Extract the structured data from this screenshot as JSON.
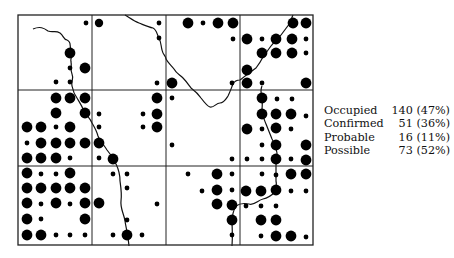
{
  "map": {
    "frame": {
      "x": 18,
      "y": 15,
      "w": 295,
      "h": 230
    },
    "grid_x": [
      92,
      166,
      240
    ],
    "grid_y": [
      90,
      166
    ],
    "dot_color": "#000000",
    "sizes": {
      "L": 5.4,
      "M": 4.2,
      "S": 2.4
    },
    "dots": [
      [
        86,
        23,
        "S"
      ],
      [
        99,
        23,
        "M"
      ],
      [
        159,
        23,
        "S"
      ],
      [
        188,
        23,
        "L"
      ],
      [
        203,
        23,
        "S"
      ],
      [
        218,
        23,
        "L"
      ],
      [
        233,
        23,
        "L"
      ],
      [
        293,
        23,
        "L"
      ],
      [
        306,
        23,
        "L"
      ],
      [
        159,
        38,
        "S"
      ],
      [
        233,
        39,
        "S"
      ],
      [
        247,
        39,
        "L"
      ],
      [
        262,
        39,
        "S"
      ],
      [
        276,
        39,
        "L"
      ],
      [
        292,
        39,
        "L"
      ],
      [
        306,
        39,
        "S"
      ],
      [
        70,
        53,
        "L"
      ],
      [
        262,
        53,
        "L"
      ],
      [
        276,
        53,
        "L"
      ],
      [
        292,
        53,
        "L"
      ],
      [
        306,
        53,
        "S"
      ],
      [
        70,
        68,
        "S"
      ],
      [
        85,
        68,
        "L"
      ],
      [
        247,
        70,
        "L"
      ],
      [
        56,
        82,
        "S"
      ],
      [
        70,
        82,
        "S"
      ],
      [
        157,
        83,
        "S"
      ],
      [
        172,
        83,
        "L"
      ],
      [
        232,
        83,
        "S"
      ],
      [
        247,
        83,
        "L"
      ],
      [
        262,
        83,
        "S"
      ],
      [
        306,
        83,
        "L"
      ],
      [
        56,
        98,
        "L"
      ],
      [
        70,
        98,
        "L"
      ],
      [
        85,
        98,
        "L"
      ],
      [
        157,
        98,
        "L"
      ],
      [
        172,
        98,
        "S"
      ],
      [
        262,
        98,
        "L"
      ],
      [
        277,
        99,
        "S"
      ],
      [
        292,
        99,
        "S"
      ],
      [
        56,
        113,
        "L"
      ],
      [
        85,
        113,
        "L"
      ],
      [
        99,
        114,
        "S"
      ],
      [
        143,
        114,
        "S"
      ],
      [
        157,
        114,
        "L"
      ],
      [
        262,
        114,
        "L"
      ],
      [
        276,
        114,
        "L"
      ],
      [
        291,
        114,
        "L"
      ],
      [
        306,
        116,
        "S"
      ],
      [
        27,
        127,
        "L"
      ],
      [
        41,
        127,
        "L"
      ],
      [
        56,
        127,
        "S"
      ],
      [
        70,
        127,
        "L"
      ],
      [
        99,
        127,
        "S"
      ],
      [
        143,
        127,
        "S"
      ],
      [
        157,
        127,
        "L"
      ],
      [
        247,
        129,
        "L"
      ],
      [
        262,
        129,
        "S"
      ],
      [
        276,
        128,
        "L"
      ],
      [
        291,
        129,
        "S"
      ],
      [
        27,
        143,
        "S"
      ],
      [
        41,
        143,
        "L"
      ],
      [
        56,
        143,
        "L"
      ],
      [
        70,
        143,
        "L"
      ],
      [
        85,
        143,
        "L"
      ],
      [
        99,
        143,
        "L"
      ],
      [
        172,
        145,
        "S"
      ],
      [
        262,
        145,
        "S"
      ],
      [
        276,
        145,
        "L"
      ],
      [
        306,
        145,
        "L"
      ],
      [
        27,
        158,
        "L"
      ],
      [
        41,
        158,
        "L"
      ],
      [
        56,
        158,
        "L"
      ],
      [
        70,
        158,
        "S"
      ],
      [
        99,
        158,
        "S"
      ],
      [
        113,
        159,
        "L"
      ],
      [
        232,
        159,
        "S"
      ],
      [
        247,
        159,
        "S"
      ],
      [
        262,
        159,
        "S"
      ],
      [
        276,
        159,
        "L"
      ],
      [
        291,
        159,
        "S"
      ],
      [
        306,
        160,
        "L"
      ],
      [
        27,
        173,
        "L"
      ],
      [
        41,
        174,
        "S"
      ],
      [
        56,
        174,
        "S"
      ],
      [
        70,
        173,
        "L"
      ],
      [
        113,
        174,
        "S"
      ],
      [
        127,
        174,
        "S"
      ],
      [
        188,
        174,
        "S"
      ],
      [
        217,
        174,
        "L"
      ],
      [
        232,
        174,
        "S"
      ],
      [
        262,
        174,
        "S"
      ],
      [
        276,
        175,
        "S"
      ],
      [
        291,
        174,
        "L"
      ],
      [
        306,
        174,
        "L"
      ],
      [
        27,
        188,
        "L"
      ],
      [
        41,
        188,
        "L"
      ],
      [
        56,
        188,
        "L"
      ],
      [
        70,
        188,
        "L"
      ],
      [
        85,
        188,
        "L"
      ],
      [
        127,
        188,
        "S"
      ],
      [
        202,
        191,
        "S"
      ],
      [
        217,
        190,
        "L"
      ],
      [
        232,
        190,
        "S"
      ],
      [
        246,
        191,
        "L"
      ],
      [
        261,
        191,
        "L"
      ],
      [
        276,
        190,
        "L"
      ],
      [
        291,
        191,
        "S"
      ],
      [
        306,
        191,
        "S"
      ],
      [
        27,
        203,
        "L"
      ],
      [
        41,
        204,
        "S"
      ],
      [
        56,
        203,
        "L"
      ],
      [
        70,
        204,
        "S"
      ],
      [
        85,
        203,
        "L"
      ],
      [
        99,
        203,
        "L"
      ],
      [
        157,
        204,
        "S"
      ],
      [
        217,
        204,
        "L"
      ],
      [
        232,
        205,
        "L"
      ],
      [
        246,
        206,
        "S"
      ],
      [
        261,
        206,
        "S"
      ],
      [
        276,
        206,
        "S"
      ],
      [
        27,
        219,
        "L"
      ],
      [
        41,
        219,
        "S"
      ],
      [
        85,
        219,
        "L"
      ],
      [
        127,
        220,
        "S"
      ],
      [
        232,
        220,
        "L"
      ],
      [
        261,
        220,
        "L"
      ],
      [
        276,
        220,
        "L"
      ],
      [
        27,
        235,
        "L"
      ],
      [
        41,
        235,
        "L"
      ],
      [
        56,
        235,
        "S"
      ],
      [
        70,
        235,
        "S"
      ],
      [
        85,
        235,
        "S"
      ],
      [
        113,
        235,
        "S"
      ],
      [
        127,
        235,
        "L"
      ],
      [
        142,
        235,
        "S"
      ],
      [
        232,
        235,
        "S"
      ],
      [
        261,
        236,
        "S"
      ],
      [
        276,
        236,
        "L"
      ],
      [
        291,
        236,
        "L"
      ],
      [
        306,
        237,
        "S"
      ]
    ],
    "rivers": [
      "M33,29 C40,26 44,28 48,31 C53,33 55,30 60,33 C64,36 63,39 67,40 C72,42 69,46 71,49 C74,53 70,57 71,62 C72,66 70,70 72,74 C74,78 71,82 72,86 C73,91 74,94 77,98 C80,103 82,106 84,111 C87,116 90,118 92,123 C95,128 97,132 98,136 C100,141 104,145 107,150 C111,155 114,159 116,164 C119,170 120,175 120,181 C121,188 122,194 121,201 C120,208 124,214 125,221 C126,228 128,234 129,246",
      "M125,15 C130,18 134,21 139,23 C144,25 148,27 153,28 C157,30 157,35 159,38 C161,42 161,46 162,50 C163,55 166,56 166,59 C168,63 172,66 174,69 C176,73 180,75 183,78 C186,81 188,84 191,88 C195,91 199,95 201,98 C204,102 207,106 210,107 C214,108 216,103 220,103 C224,103 226,99 228,96 C230,92 231,89 233,84 C235,80 238,80 240,80 C243,78 246,75 248,74 C251,72 253,70 256,68 C259,64 261,61 263,57 C266,53 268,50 271,46 C274,42 278,39 281,35 C284,31 287,27 290,23 C291,20 292,17 293,15",
      "M262,86 C260,90 261,94 262,98 C263,102 262,106 262,110 C262,115 264,119 266,124 C268,129 270,134 272,139 C275,144 276,148 277,153 C277,157 276,161 276,166 C276,171 276,176 276,181 C277,185 276,188 275,192 C271,196 268,198 263,199 C258,200 254,206 249,204 C244,203 240,203 236,206 C233,211 232,216 232,222 C232,228 233,234 232,246"
    ]
  },
  "legend": {
    "rows": [
      {
        "label": "Occupied",
        "value": "140 (47%)"
      },
      {
        "label": "Confirmed",
        "value": "51 (36%)"
      },
      {
        "label": "Probable",
        "value": "16 (11%)"
      },
      {
        "label": "Possible",
        "value": "73 (52%)"
      }
    ]
  }
}
